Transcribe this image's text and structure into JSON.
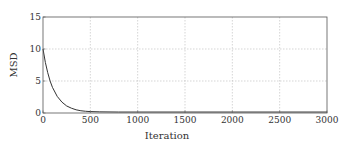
{
  "chart_data": {
    "type": "line",
    "title": "",
    "xlabel": "Iteration",
    "ylabel": "MSD",
    "xlim": [
      0,
      3000
    ],
    "ylim": [
      0,
      15
    ],
    "xticks": [
      0,
      500,
      1000,
      1500,
      2000,
      2500,
      3000
    ],
    "yticks": [
      0,
      5,
      10,
      15
    ],
    "xtick_labels": [
      "0",
      "500",
      "1000",
      "1500",
      "2000",
      "2500",
      "3000"
    ],
    "ytick_labels": [
      "0",
      "5",
      "10",
      "15"
    ],
    "grid": true,
    "legend": null,
    "series": [
      {
        "name": "MSD",
        "color": "#333333",
        "x": [
          0,
          25,
          50,
          75,
          100,
          150,
          200,
          250,
          300,
          350,
          400,
          450,
          500,
          600,
          800,
          1000,
          1500,
          2000,
          2500,
          3000
        ],
        "values": [
          10.0,
          7.9,
          6.3,
          5.0,
          4.0,
          2.6,
          1.7,
          1.1,
          0.75,
          0.5,
          0.35,
          0.27,
          0.22,
          0.18,
          0.15,
          0.15,
          0.15,
          0.15,
          0.15,
          0.15
        ]
      }
    ]
  },
  "colors": {
    "line": "#333333",
    "grid": "#bbbbbb",
    "axes": "#555555"
  }
}
